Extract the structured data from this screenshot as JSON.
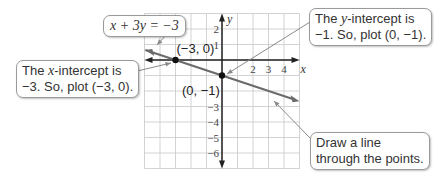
{
  "chart_data": {
    "type": "line",
    "title": "",
    "equation": "x + 3y = −3",
    "xlabel": "x",
    "ylabel": "y",
    "xlim": [
      -5,
      5
    ],
    "ylim": [
      -7,
      3
    ],
    "grid": true,
    "x_ticks": [
      2,
      3,
      4
    ],
    "y_ticks": [
      2,
      1,
      -3,
      -4,
      -5,
      -6
    ],
    "x_tick_labels": [
      "2",
      "3",
      "4"
    ],
    "y_tick_labels": [
      "2",
      "1",
      "−3",
      "−4",
      "−5",
      "−6"
    ],
    "line": {
      "slope": -0.3333,
      "intercept": -1,
      "x_range": [
        -5,
        5
      ]
    },
    "points": [
      {
        "x": -3,
        "y": 0,
        "label": "(−3, 0)"
      },
      {
        "x": 0,
        "y": -1,
        "label": "(0, −1)"
      }
    ],
    "colors": {
      "line": "#6b6b6b",
      "axis": "#222222",
      "grid": "#c8c8c8",
      "point": "#111111",
      "leader": "#8a8a8a"
    }
  },
  "callouts": {
    "equation": {
      "text": "x + 3y = −3"
    },
    "x_intercept": {
      "line1_pre": "The ",
      "line1_var": "x",
      "line1_post": "-intercept is",
      "line2": "−3.  So, plot (−3, 0)."
    },
    "y_intercept": {
      "line1_pre": "The ",
      "line1_var": "y",
      "line1_post": "-intercept is",
      "line2": "−1.  So, plot (0, −1)."
    },
    "draw_line": {
      "line1": "Draw a line",
      "line2": "through the points."
    }
  }
}
